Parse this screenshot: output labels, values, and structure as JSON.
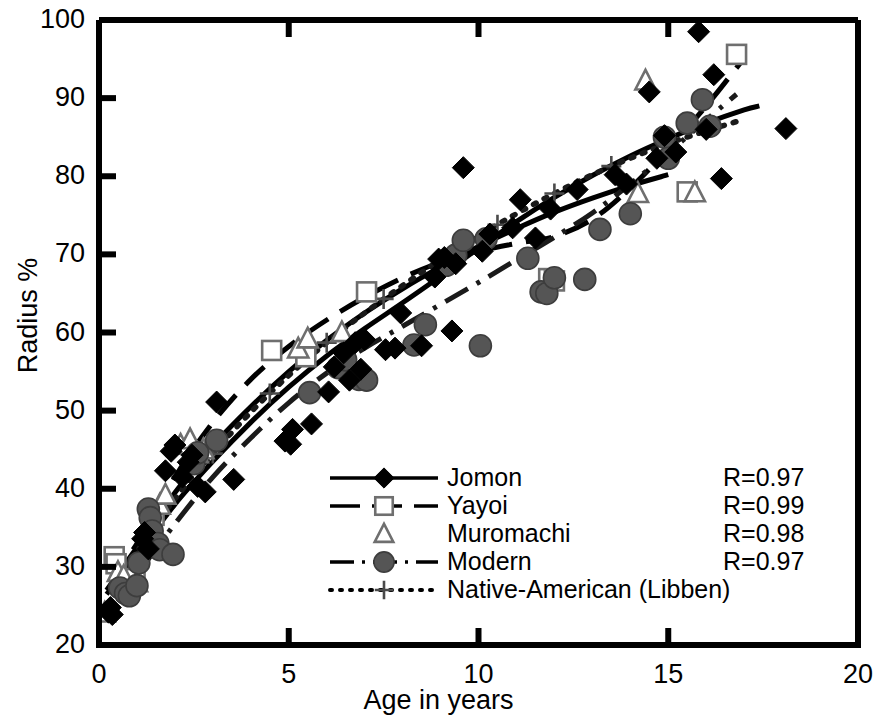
{
  "chart_data": {
    "type": "scatter",
    "title": "",
    "xlabel": "Age in years",
    "ylabel": "Radius %",
    "xlim": [
      0,
      20
    ],
    "ylim": [
      20,
      100
    ],
    "xticks": [
      0,
      5,
      10,
      15,
      20
    ],
    "yticks": [
      20,
      30,
      40,
      50,
      60,
      70,
      80,
      90,
      100
    ],
    "grid": false,
    "legend_position": "inside-bottom-center",
    "series": [
      {
        "name": "Jomon",
        "marker": "filled-diamond",
        "line": "solid",
        "color": "#000000",
        "R": "R=0.97",
        "points": [
          [
            0.25,
            24.2
          ],
          [
            0.3,
            24.8
          ],
          [
            0.35,
            23.9
          ],
          [
            1.15,
            33.6
          ],
          [
            1.2,
            34.4
          ],
          [
            1.3,
            32.3
          ],
          [
            1.75,
            42.3
          ],
          [
            1.9,
            44.8
          ],
          [
            2.0,
            45.6
          ],
          [
            2.2,
            41.5
          ],
          [
            2.35,
            43.4
          ],
          [
            2.45,
            44.3
          ],
          [
            2.6,
            40.3
          ],
          [
            2.8,
            39.6
          ],
          [
            3.1,
            51.1
          ],
          [
            3.55,
            41.2
          ],
          [
            4.9,
            46.1
          ],
          [
            5.05,
            45.7
          ],
          [
            5.1,
            47.6
          ],
          [
            5.6,
            48.3
          ],
          [
            6.05,
            52.4
          ],
          [
            6.2,
            55.6
          ],
          [
            6.45,
            57.4
          ],
          [
            6.6,
            53.9
          ],
          [
            6.75,
            58.7
          ],
          [
            6.9,
            55.3
          ],
          [
            7.0,
            59.1
          ],
          [
            7.55,
            57.8
          ],
          [
            7.8,
            58.0
          ],
          [
            7.95,
            62.5
          ],
          [
            8.5,
            58.3
          ],
          [
            8.85,
            67.1
          ],
          [
            8.95,
            69.4
          ],
          [
            9.1,
            69.6
          ],
          [
            9.3,
            60.2
          ],
          [
            9.4,
            68.8
          ],
          [
            9.6,
            81.1
          ],
          [
            10.1,
            70.4
          ],
          [
            10.3,
            72.6
          ],
          [
            10.9,
            73.4
          ],
          [
            11.1,
            77.0
          ],
          [
            11.5,
            72.1
          ],
          [
            11.9,
            75.8
          ],
          [
            12.6,
            78.3
          ],
          [
            13.6,
            80.2
          ],
          [
            13.9,
            79.0
          ],
          [
            14.5,
            90.8
          ],
          [
            14.7,
            82.3
          ],
          [
            14.9,
            85.2
          ],
          [
            15.2,
            83.1
          ],
          [
            15.8,
            98.5
          ],
          [
            16.0,
            86.0
          ],
          [
            16.2,
            93.0
          ],
          [
            16.4,
            79.7
          ],
          [
            18.1,
            86.1
          ]
        ],
        "fit_points": [
          [
            0.2,
            26.5
          ],
          [
            1,
            31.5
          ],
          [
            2,
            38.0
          ],
          [
            3,
            43.5
          ],
          [
            4,
            48.5
          ],
          [
            5,
            53.0
          ],
          [
            6,
            57.0
          ],
          [
            7,
            60.5
          ],
          [
            8,
            63.8
          ],
          [
            9,
            67.2
          ],
          [
            10,
            70.8
          ],
          [
            11,
            74.2
          ],
          [
            12,
            77.3
          ],
          [
            13,
            80.1
          ],
          [
            14,
            82.6
          ],
          [
            15,
            84.8
          ],
          [
            16,
            86.8
          ],
          [
            17,
            88.5
          ],
          [
            17.4,
            89.0
          ]
        ]
      },
      {
        "name": "Yayoi",
        "marker": "open-square",
        "line": "dashed",
        "color": "#000000",
        "R": "R=0.99",
        "points": [
          [
            0.4,
            31.3
          ],
          [
            0.45,
            30.4
          ],
          [
            0.85,
            28.2
          ],
          [
            0.95,
            28.5
          ],
          [
            1.45,
            36.6
          ],
          [
            2.5,
            44.1
          ],
          [
            4.55,
            57.7
          ],
          [
            5.45,
            56.9
          ],
          [
            7.05,
            65.2
          ],
          [
            11.85,
            66.9
          ],
          [
            12.0,
            66.6
          ],
          [
            15.5,
            78.0
          ],
          [
            16.8,
            95.6
          ]
        ],
        "fit_points": [
          [
            0.3,
            28.0
          ],
          [
            1,
            33.0
          ],
          [
            2,
            41.5
          ],
          [
            3,
            48.5
          ],
          [
            4,
            54.0
          ],
          [
            5,
            58.2
          ],
          [
            6,
            61.6
          ],
          [
            7,
            64.5
          ],
          [
            8,
            67.0
          ],
          [
            9,
            69.0
          ],
          [
            10,
            70.4
          ],
          [
            11,
            71.4
          ],
          [
            12,
            72.3
          ],
          [
            13,
            74.5
          ],
          [
            14,
            78.5
          ],
          [
            15,
            83.5
          ],
          [
            16,
            89.0
          ],
          [
            16.9,
            94.5
          ]
        ]
      },
      {
        "name": "Muromachi",
        "marker": "open-triangle",
        "line": "none",
        "color": "#000000",
        "R": "R=0.98",
        "points": [
          [
            0.15,
            24.1
          ],
          [
            0.5,
            29.3
          ],
          [
            0.65,
            28.8
          ],
          [
            1.0,
            28.0
          ],
          [
            1.6,
            37.9
          ],
          [
            1.75,
            39.2
          ],
          [
            2.15,
            45.6
          ],
          [
            2.4,
            46.3
          ],
          [
            2.6,
            44.5
          ],
          [
            2.75,
            45.0
          ],
          [
            5.25,
            57.9
          ],
          [
            5.5,
            59.2
          ],
          [
            6.4,
            60.0
          ],
          [
            14.2,
            77.8
          ],
          [
            14.4,
            92.2
          ],
          [
            15.7,
            77.9
          ]
        ],
        "fit_points": [
          [
            0.2,
            27.0
          ],
          [
            1,
            32.5
          ],
          [
            2,
            39.5
          ],
          [
            3,
            45.5
          ],
          [
            4,
            50.5
          ],
          [
            5,
            55.0
          ],
          [
            6,
            59.0
          ],
          [
            7,
            62.5
          ],
          [
            8,
            65.6
          ],
          [
            9,
            68.4
          ],
          [
            10,
            71.0
          ],
          [
            11,
            73.3
          ],
          [
            12,
            75.4
          ],
          [
            13,
            77.2
          ],
          [
            14,
            78.8
          ],
          [
            15,
            80.2
          ]
        ]
      },
      {
        "name": "Modern",
        "marker": "filled-circle",
        "line": "dash-dot",
        "color": "#555555",
        "R": "R=0.97",
        "points": [
          [
            0.55,
            27.3
          ],
          [
            0.7,
            26.6
          ],
          [
            0.8,
            26.3
          ],
          [
            1.0,
            27.6
          ],
          [
            1.05,
            30.5
          ],
          [
            1.3,
            37.4
          ],
          [
            1.35,
            36.3
          ],
          [
            1.4,
            34.6
          ],
          [
            1.55,
            33.0
          ],
          [
            1.6,
            32.2
          ],
          [
            1.95,
            31.6
          ],
          [
            2.5,
            43.2
          ],
          [
            2.6,
            44.6
          ],
          [
            3.1,
            46.2
          ],
          [
            5.55,
            52.3
          ],
          [
            6.3,
            55.5
          ],
          [
            6.5,
            56.5
          ],
          [
            6.85,
            54.0
          ],
          [
            7.05,
            53.9
          ],
          [
            8.3,
            58.4
          ],
          [
            8.6,
            61.0
          ],
          [
            9.15,
            68.6
          ],
          [
            9.4,
            69.9
          ],
          [
            9.6,
            71.8
          ],
          [
            10.05,
            58.3
          ],
          [
            10.2,
            72.0
          ],
          [
            11.3,
            69.5
          ],
          [
            11.65,
            65.2
          ],
          [
            11.8,
            65.0
          ],
          [
            12.0,
            67.0
          ],
          [
            12.8,
            66.8
          ],
          [
            13.2,
            73.2
          ],
          [
            14.0,
            75.2
          ],
          [
            14.9,
            85.0
          ],
          [
            15.0,
            82.3
          ],
          [
            15.5,
            86.8
          ],
          [
            15.9,
            89.8
          ],
          [
            16.1,
            86.4
          ]
        ],
        "fit_points": [
          [
            0.5,
            25.5
          ],
          [
            1,
            29.0
          ],
          [
            2,
            35.5
          ],
          [
            3,
            41.5
          ],
          [
            4,
            46.5
          ],
          [
            5,
            51.0
          ],
          [
            6,
            54.8
          ],
          [
            7,
            58.0
          ],
          [
            8,
            60.8
          ],
          [
            9,
            63.6
          ],
          [
            10,
            66.4
          ],
          [
            11,
            69.3
          ],
          [
            12,
            72.2
          ],
          [
            13,
            75.3
          ],
          [
            14,
            79.0
          ],
          [
            15,
            83.0
          ],
          [
            16,
            87.2
          ],
          [
            16.8,
            90.5
          ]
        ]
      },
      {
        "name": "Native-American (Libben)",
        "marker": "plus",
        "line": "dotted",
        "color": "#000000",
        "R": "",
        "points": [],
        "fit_points": [
          [
            0.3,
            27.5
          ],
          [
            1,
            32.0
          ],
          [
            2,
            38.7
          ],
          [
            3,
            44.5
          ],
          [
            4,
            49.8
          ],
          [
            5,
            54.5
          ],
          [
            6,
            58.7
          ],
          [
            7,
            62.5
          ],
          [
            8,
            66.0
          ],
          [
            9,
            69.3
          ],
          [
            10,
            72.4
          ],
          [
            11,
            75.2
          ],
          [
            12,
            77.8
          ],
          [
            13,
            80.2
          ],
          [
            14,
            82.3
          ],
          [
            15,
            84.2
          ],
          [
            16,
            85.8
          ],
          [
            16.8,
            87.0
          ]
        ],
        "tick_marks": [
          [
            3.0,
            44.5
          ],
          [
            4.5,
            52.2
          ],
          [
            6.0,
            58.7
          ],
          [
            7.5,
            64.3
          ],
          [
            9.0,
            69.3
          ],
          [
            10.5,
            73.8
          ],
          [
            12.0,
            77.8
          ],
          [
            13.5,
            81.3
          ]
        ]
      }
    ],
    "legend": [
      {
        "label": "Jomon",
        "marker": "filled-diamond",
        "line": "solid"
      },
      {
        "label": "Yayoi",
        "marker": "open-square",
        "line": "dashed"
      },
      {
        "label": "Muromachi",
        "marker": "open-triangle",
        "line": "none"
      },
      {
        "label": "Modern",
        "marker": "filled-circle",
        "line": "dash-dot"
      },
      {
        "label": "Native-American (Libben)",
        "marker": "plus",
        "line": "dotted"
      }
    ],
    "annotations": [
      {
        "text": "R=0.97"
      },
      {
        "text": "R=0.99"
      },
      {
        "text": "R=0.98"
      },
      {
        "text": "R=0.97"
      }
    ]
  },
  "axis": {
    "y_label": "Radius %",
    "x_label": "Age in years",
    "y_ticks": [
      "100",
      "90",
      "80",
      "70",
      "60",
      "50",
      "40",
      "30",
      "20"
    ],
    "x_ticks": [
      "0",
      "5",
      "10",
      "15",
      "20"
    ]
  },
  "colors": {
    "axis": "#000000",
    "modern_marker": "#555555",
    "background": "#ffffff"
  }
}
